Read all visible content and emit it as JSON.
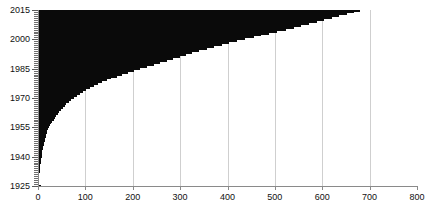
{
  "chart_data": {
    "type": "bar",
    "orientation": "horizontal",
    "title": "",
    "subtitle": "",
    "xlabel": "",
    "ylabel": "",
    "xlim": [
      0,
      800
    ],
    "ylim": [
      1925,
      2015
    ],
    "grid": "vertical-only",
    "legend": null,
    "bar_color": "#0a0a0a",
    "grid_color": "#cfcfcf",
    "axis_color": "#8a8a8a",
    "x_ticks": [
      0,
      100,
      200,
      300,
      400,
      500,
      600,
      700,
      800
    ],
    "x_tick_labels": [
      "0",
      "100",
      "200",
      "300",
      "400",
      "500",
      "600",
      "700",
      "800"
    ],
    "y_ticks": [
      1925,
      1940,
      1955,
      1970,
      1985,
      2000,
      2015
    ],
    "y_tick_labels": [
      "1925",
      "1940",
      "1955",
      "1970",
      "1985",
      "2000",
      "2015"
    ],
    "y_minor_tick_step": 1,
    "categories": [
      1925,
      1926,
      1927,
      1928,
      1929,
      1930,
      1931,
      1932,
      1933,
      1934,
      1935,
      1936,
      1937,
      1938,
      1939,
      1940,
      1941,
      1942,
      1943,
      1944,
      1945,
      1946,
      1947,
      1948,
      1949,
      1950,
      1951,
      1952,
      1953,
      1954,
      1955,
      1956,
      1957,
      1958,
      1959,
      1960,
      1961,
      1962,
      1963,
      1964,
      1965,
      1966,
      1967,
      1968,
      1969,
      1970,
      1971,
      1972,
      1973,
      1974,
      1975,
      1976,
      1977,
      1978,
      1979,
      1980,
      1981,
      1982,
      1983,
      1984,
      1985,
      1986,
      1987,
      1988,
      1989,
      1990,
      1991,
      1992,
      1993,
      1994,
      1995,
      1996,
      1997,
      1998,
      1999,
      2000,
      2001,
      2002,
      2003,
      2004,
      2005,
      2006,
      2007,
      2008,
      2009,
      2010,
      2011,
      2012,
      2013,
      2014,
      2015
    ],
    "values": [
      6,
      2,
      2,
      2,
      3,
      3,
      3,
      4,
      4,
      4,
      5,
      5,
      6,
      6,
      7,
      8,
      8,
      9,
      9,
      10,
      11,
      12,
      13,
      14,
      15,
      16,
      17,
      18,
      20,
      22,
      24,
      26,
      28,
      30,
      33,
      36,
      39,
      42,
      45,
      48,
      52,
      56,
      60,
      65,
      70,
      76,
      82,
      88,
      95,
      102,
      110,
      118,
      126,
      135,
      145,
      155,
      166,
      178,
      190,
      203,
      216,
      230,
      245,
      258,
      272,
      286,
      300,
      312,
      326,
      340,
      356,
      372,
      388,
      404,
      420,
      437,
      455,
      470,
      487,
      505,
      523,
      540,
      556,
      572,
      588,
      604,
      620,
      636,
      652,
      668,
      680
    ]
  }
}
